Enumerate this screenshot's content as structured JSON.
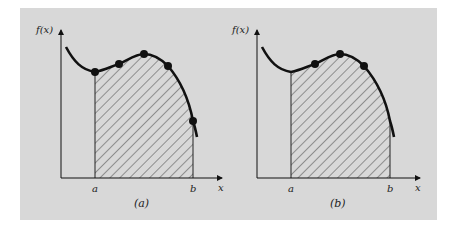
{
  "figure": {
    "background_color": "#d8d8d8",
    "ink_color": "#111111",
    "panels": [
      {
        "id": "a",
        "caption": "(a)",
        "y_axis_label": "f(x)",
        "x_axis_label": "x",
        "lower_limit_label": "a",
        "upper_limit_label": "b",
        "marked_points": 5,
        "description": "Shaded area under f(x) from a to b with data points at both endpoints and three interior points"
      },
      {
        "id": "b",
        "caption": "(b)",
        "y_axis_label": "f(x)",
        "x_axis_label": "x",
        "lower_limit_label": "a",
        "upper_limit_label": "b",
        "marked_points": 3,
        "description": "Shaded area under f(x) from a to b with three interior data points only (endpoints not marked)"
      }
    ]
  }
}
